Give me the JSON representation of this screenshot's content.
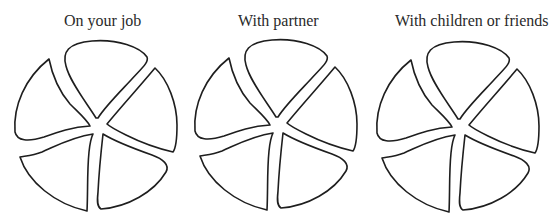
{
  "panels": [
    {
      "title": "On your job",
      "segments": [
        "top",
        "right",
        "lower-right",
        "lower-left",
        "upper-left"
      ]
    },
    {
      "title": "With partner",
      "segments": [
        "top",
        "right",
        "lower-right",
        "lower-left",
        "upper-left"
      ]
    },
    {
      "title": "With children or friends",
      "segments": [
        "top",
        "right",
        "lower-right",
        "lower-left",
        "upper-left"
      ]
    }
  ],
  "style": {
    "stroke_color": "#1e1e1e",
    "fill_color": "#ffffff",
    "background": "#ffffff"
  }
}
